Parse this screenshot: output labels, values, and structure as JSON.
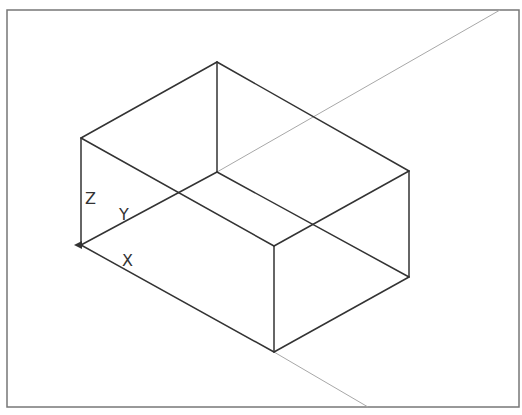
{
  "drawing": {
    "title": "Isometric box with UCS icon",
    "frame": {
      "x1": 7,
      "y1": 10,
      "x2": 519,
      "y2": 407,
      "color": "#777777"
    },
    "colors": {
      "edge": "#333333",
      "construction": "#a8a8a8",
      "background": "#ffffff"
    },
    "box_vertices": {
      "origin": [
        81,
        245
      ],
      "left_top": [
        81,
        138
      ],
      "apex_top": [
        217,
        62
      ],
      "back_bottom": [
        217,
        172
      ],
      "right_top": [
        409,
        171
      ],
      "right_bottom": [
        409,
        277
      ],
      "front_top": [
        274,
        246
      ],
      "front_bottom": [
        274,
        352
      ]
    },
    "construction_lines": [
      {
        "from": [
          217,
          172
        ],
        "to": [
          500,
          10
        ]
      },
      {
        "from": [
          274,
          352
        ],
        "to": [
          368,
          407
        ]
      }
    ],
    "ucs": {
      "labels": {
        "x": "X",
        "y": "Y",
        "z": "Z"
      },
      "label_positions": {
        "z": [
          85,
          204
        ],
        "y": [
          119,
          219
        ],
        "x": [
          122,
          265
        ]
      }
    }
  }
}
